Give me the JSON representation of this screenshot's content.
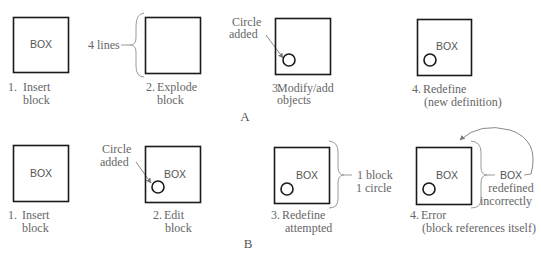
{
  "figure": {
    "panel_a": {
      "label": "A",
      "steps": [
        {
          "number": "1.",
          "caption_line1": "Insert",
          "caption_line2": "block",
          "box_label": "BOX"
        },
        {
          "number": "2.",
          "caption_line1": "Explode",
          "caption_line2": "block",
          "annotation": "4 lines"
        },
        {
          "number": "3.",
          "caption_line1": "Modify/add",
          "caption_line2": "objects",
          "annotation_line1": "Circle",
          "annotation_line2": "added"
        },
        {
          "number": "4.",
          "caption_line1": "Redefine",
          "caption_line2": "(new definition)",
          "box_label": "BOX"
        }
      ]
    },
    "panel_b": {
      "label": "B",
      "steps": [
        {
          "number": "1.",
          "caption_line1": "Insert",
          "caption_line2": "block",
          "box_label": "BOX"
        },
        {
          "number": "2.",
          "caption_line1": "Edit",
          "caption_line2": "block",
          "box_label": "BOX",
          "annotation_line1": "Circle",
          "annotation_line2": "added"
        },
        {
          "number": "3.",
          "caption_line1": "Redefine",
          "caption_line2": "attempted",
          "box_label": "BOX",
          "annotation_line1": "1 block",
          "annotation_line2": "1 circle"
        },
        {
          "number": "4.",
          "caption_line1": "Error",
          "caption_line2": "(block references itself)",
          "box_label": "BOX",
          "annotation_line1": "BOX",
          "annotation_line2": "redefined",
          "annotation_line3": "incorrectly"
        }
      ]
    }
  }
}
